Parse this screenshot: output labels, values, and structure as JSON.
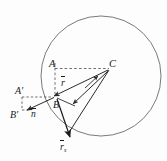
{
  "figure": {
    "background_color": "#fdfdfd",
    "stroke_color": "#555555",
    "text_color": "#1a1a1a",
    "labels": {
      "point_a": "A",
      "point_a_prime": "A′",
      "point_b": "B",
      "point_b_prime": "B′",
      "point_c": "C",
      "vector_r": "r",
      "vector_n": "n",
      "vector_tau_base": "r",
      "vector_tau_sub": "s"
    },
    "geometry": {
      "circle": {
        "cx": 101,
        "cy": 76,
        "r": 60
      },
      "points": {
        "A": {
          "x": 53,
          "y": 69
        },
        "C": {
          "x": 110,
          "y": 69
        },
        "B": {
          "x": 53,
          "y": 96
        },
        "A_prime": {
          "x": 25,
          "y": 96
        },
        "B_prime": {
          "x": 25,
          "y": 113
        }
      }
    }
  }
}
